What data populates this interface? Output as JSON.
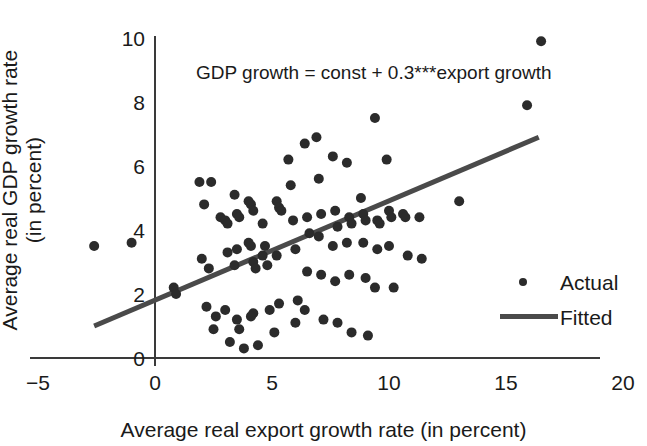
{
  "chart_data": {
    "type": "scatter",
    "title": "",
    "xlabel": "Average real export growth rate (in percent)",
    "ylabel_line1": "Average real GDP growth rate",
    "ylabel_line2": "(in percent)",
    "annotation": "GDP growth = const + 0.3***export growth",
    "xlim": [
      -5,
      20
    ],
    "ylim": [
      0,
      10
    ],
    "xticks": [
      -5,
      0,
      5,
      10,
      15,
      20
    ],
    "xtick_labels": [
      "−5",
      "0",
      "5",
      "10",
      "15",
      "20"
    ],
    "yticks": [
      0,
      2,
      4,
      6,
      8,
      10
    ],
    "ytick_labels": [
      "0",
      "2",
      "4",
      "6",
      "8",
      "10"
    ],
    "grid": false,
    "legend_position": "bottom-right",
    "legend": [
      {
        "name": "Actual",
        "kind": "marker"
      },
      {
        "name": "Fitted",
        "kind": "line"
      }
    ],
    "colors": {
      "marker": "#2b2b2b",
      "fit_line": "#4a4a4a",
      "axis": "#3a3a3a",
      "text": "#1a1a1a",
      "background": "#ffffff"
    },
    "series": [
      {
        "name": "Actual",
        "kind": "scatter",
        "points": [
          [
            -2.6,
            3.5
          ],
          [
            -1.0,
            3.6
          ],
          [
            0.8,
            2.2
          ],
          [
            0.9,
            2.0
          ],
          [
            1.9,
            5.5
          ],
          [
            2.4,
            5.5
          ],
          [
            2.1,
            4.8
          ],
          [
            2.0,
            3.1
          ],
          [
            2.3,
            2.8
          ],
          [
            2.2,
            1.6
          ],
          [
            2.6,
            1.3
          ],
          [
            2.5,
            0.9
          ],
          [
            2.8,
            4.4
          ],
          [
            3.0,
            4.3
          ],
          [
            3.1,
            4.2
          ],
          [
            3.1,
            3.3
          ],
          [
            3.0,
            1.5
          ],
          [
            3.2,
            0.5
          ],
          [
            3.4,
            5.1
          ],
          [
            3.5,
            4.5
          ],
          [
            3.6,
            4.4
          ],
          [
            3.5,
            3.4
          ],
          [
            3.4,
            2.9
          ],
          [
            3.5,
            1.2
          ],
          [
            3.6,
            0.9
          ],
          [
            3.8,
            0.3
          ],
          [
            4.0,
            4.9
          ],
          [
            4.1,
            4.8
          ],
          [
            4.2,
            4.6
          ],
          [
            4.0,
            3.6
          ],
          [
            4.1,
            3.5
          ],
          [
            4.2,
            3.0
          ],
          [
            4.3,
            2.8
          ],
          [
            4.2,
            1.4
          ],
          [
            4.1,
            1.3
          ],
          [
            4.4,
            0.4
          ],
          [
            4.6,
            4.2
          ],
          [
            4.7,
            3.5
          ],
          [
            4.6,
            3.2
          ],
          [
            4.8,
            2.9
          ],
          [
            4.9,
            1.5
          ],
          [
            5.2,
            4.9
          ],
          [
            5.3,
            4.7
          ],
          [
            5.4,
            4.6
          ],
          [
            5.2,
            3.2
          ],
          [
            5.3,
            1.7
          ],
          [
            5.1,
            0.8
          ],
          [
            5.7,
            6.2
          ],
          [
            5.8,
            5.4
          ],
          [
            5.9,
            4.3
          ],
          [
            6.0,
            3.4
          ],
          [
            6.1,
            1.8
          ],
          [
            6.0,
            1.1
          ],
          [
            6.4,
            6.7
          ],
          [
            6.5,
            4.4
          ],
          [
            6.6,
            3.9
          ],
          [
            6.5,
            2.7
          ],
          [
            6.4,
            1.5
          ],
          [
            6.9,
            6.9
          ],
          [
            7.0,
            5.6
          ],
          [
            7.1,
            4.5
          ],
          [
            7.0,
            3.8
          ],
          [
            7.1,
            2.6
          ],
          [
            7.2,
            1.2
          ],
          [
            7.6,
            6.3
          ],
          [
            7.7,
            4.6
          ],
          [
            7.8,
            4.1
          ],
          [
            7.6,
            3.5
          ],
          [
            7.7,
            2.4
          ],
          [
            7.8,
            1.1
          ],
          [
            8.2,
            6.1
          ],
          [
            8.3,
            4.4
          ],
          [
            8.4,
            4.2
          ],
          [
            8.2,
            3.6
          ],
          [
            8.3,
            2.6
          ],
          [
            8.4,
            0.8
          ],
          [
            8.8,
            5.0
          ],
          [
            8.9,
            4.5
          ],
          [
            9.0,
            4.3
          ],
          [
            8.9,
            3.6
          ],
          [
            9.0,
            2.5
          ],
          [
            9.1,
            0.7
          ],
          [
            9.4,
            7.5
          ],
          [
            9.5,
            4.3
          ],
          [
            9.6,
            4.2
          ],
          [
            9.5,
            3.4
          ],
          [
            9.4,
            2.2
          ],
          [
            9.9,
            6.2
          ],
          [
            10.0,
            4.6
          ],
          [
            10.1,
            4.4
          ],
          [
            10.0,
            3.5
          ],
          [
            10.2,
            2.2
          ],
          [
            10.6,
            4.5
          ],
          [
            10.7,
            4.4
          ],
          [
            10.8,
            3.2
          ],
          [
            11.3,
            4.4
          ],
          [
            11.4,
            3.1
          ],
          [
            13.0,
            4.9
          ],
          [
            15.9,
            7.9
          ],
          [
            16.5,
            9.9
          ]
        ]
      },
      {
        "name": "Fitted",
        "kind": "line",
        "equation": "GDP growth = const + 0.3***export growth",
        "slope": 0.31,
        "endpoints": [
          [
            -2.6,
            1.0
          ],
          [
            16.4,
            6.9
          ]
        ]
      }
    ]
  },
  "legend": {
    "actual_label": "Actual",
    "fitted_label": "Fitted"
  },
  "axes": {
    "x_title": "Average real export growth rate (in percent)",
    "y_title_line1": "Average real GDP growth rate",
    "y_title_line2": "(in percent)"
  },
  "annotation_text": "GDP growth = const + 0.3***export growth"
}
